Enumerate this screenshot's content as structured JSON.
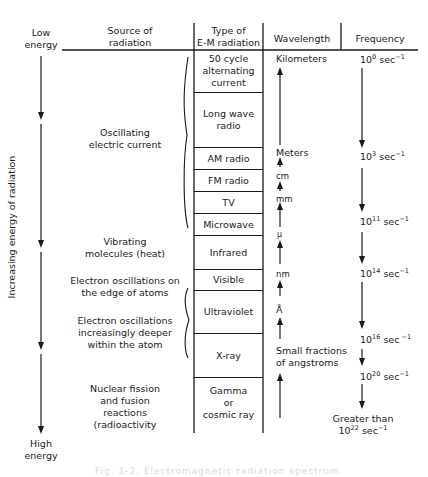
{
  "left_axis": {
    "top_label": [
      "Low",
      "energy"
    ],
    "bottom_label": [
      "High",
      "energy"
    ],
    "vertical_label": "Increasing energy of radiation"
  },
  "headers": {
    "source": [
      "Source of",
      "radiation"
    ],
    "type": [
      "Type of",
      "E-M radiation"
    ],
    "wavelength": "Wavelength",
    "frequency": "Frequency"
  },
  "sources": [
    {
      "lines": [
        "Oscillating",
        "electric current"
      ]
    },
    {
      "lines": [
        "Vibrating",
        "molecules (heat)"
      ]
    },
    {
      "lines": [
        "Electron oscillations on",
        "the edge of atoms"
      ]
    },
    {
      "lines": [
        "Electron oscillations",
        "increasingly deeper",
        "within the atom"
      ]
    },
    {
      "lines": [
        "Nuclear fission",
        "and fusion",
        "reactions",
        "(radioactivity"
      ]
    }
  ],
  "types": [
    {
      "lines": [
        "50 cycle",
        "alternating",
        "current"
      ]
    },
    {
      "lines": [
        "Long wave",
        "radio"
      ]
    },
    {
      "lines": [
        "AM radio"
      ]
    },
    {
      "lines": [
        "FM radio"
      ]
    },
    {
      "lines": [
        "TV"
      ]
    },
    {
      "lines": [
        "Microwave"
      ]
    },
    {
      "lines": [
        "Infrared"
      ]
    },
    {
      "lines": [
        "Visible"
      ]
    },
    {
      "lines": [
        "Ultraviolet"
      ]
    },
    {
      "lines": [
        "X-ray"
      ]
    },
    {
      "lines": [
        "Gamma",
        "or",
        "cosmic ray"
      ]
    }
  ],
  "wavelengths": [
    {
      "label": "Kilometers"
    },
    {
      "label": "Meters"
    },
    {
      "label": "cm"
    },
    {
      "label": "mm"
    },
    {
      "label": "μ"
    },
    {
      "label": "nm"
    },
    {
      "label": "Å"
    },
    {
      "label_lines": [
        "Small fractions",
        "of angstroms"
      ]
    }
  ],
  "frequencies": [
    {
      "base": "10",
      "exp": "0",
      "unit": " sec",
      "unit_exp": "−1"
    },
    {
      "base": "10",
      "exp": "3",
      "unit": " sec",
      "unit_exp": "−1"
    },
    {
      "base": "10",
      "exp": "11",
      "unit": " sec",
      "unit_exp": "−1"
    },
    {
      "base": "10",
      "exp": "14",
      "unit": " sec",
      "unit_exp": "−1"
    },
    {
      "base": "10",
      "exp": "16",
      "unit": " sec",
      "unit_exp": " −1"
    },
    {
      "base": "10",
      "exp": "20",
      "unit": " sec",
      "unit_exp": "−1"
    },
    {
      "prefix": "Greater than",
      "base": "10",
      "exp": "22",
      "unit": " sec",
      "unit_exp": "−1"
    }
  ],
  "caption": "Fig. 1-2.  Electromagnetic radiation spectrum."
}
